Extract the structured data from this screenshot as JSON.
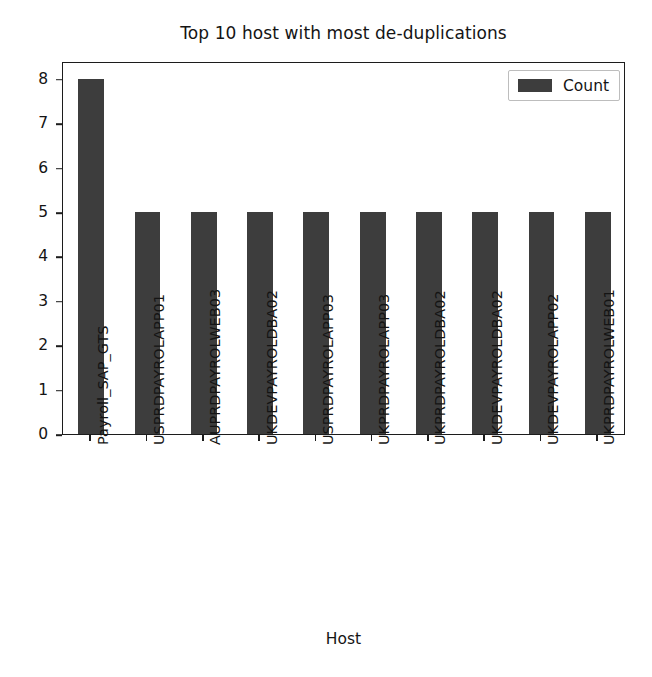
{
  "chart_data": {
    "type": "bar",
    "title": "Top 10 host with most de-duplications",
    "xlabel": "Host",
    "ylabel": "",
    "grid": false,
    "legend_position": "upper right",
    "ylim": [
      0,
      8.4
    ],
    "yticks": [
      0,
      1,
      2,
      3,
      4,
      5,
      6,
      7,
      8
    ],
    "categories": [
      "Payroll_SAP_GTS",
      "USPRDPAYROLAPP01",
      "AUPRDPAYROLWEB03",
      "UKDEVPAYROLDBA02",
      "USPRDPAYROLAPP03",
      "UKPRDPAYROLAPP03",
      "UKPRDPAYROLDBA02",
      "UKDEVPAYROLDBA02",
      "UKDEVPAYROLAPP02",
      "UKPRDPAYROLWEB01"
    ],
    "series": [
      {
        "name": "Count",
        "color": "#3d3d3d",
        "values": [
          8,
          5,
          5,
          5,
          5,
          5,
          5,
          5,
          5,
          5
        ]
      }
    ]
  },
  "legend": {
    "entries": [
      {
        "label": "Count",
        "color": "#3d3d3d"
      }
    ]
  },
  "style": {
    "background": "#ffffff",
    "axis_color": "#1c1c1c",
    "text_color": "#141414",
    "bar_color": "#3d3d3d",
    "legend_border": "#bdbdbd"
  }
}
